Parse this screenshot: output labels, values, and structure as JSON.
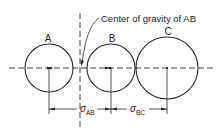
{
  "labels": {
    "circle_a": "A",
    "circle_b": "B",
    "circle_c": "C",
    "cg_annotation": "Center of gravity of AB",
    "sigma": "σ",
    "sub_ab": "AB",
    "sub_bc": "BC"
  },
  "colors": {
    "stroke": "#2a2a2a",
    "background": "#ffffff"
  },
  "geometry": {
    "axis_y": 68,
    "circles": [
      {
        "name": "A",
        "cx": 49,
        "cy": 68,
        "r": 24
      },
      {
        "name": "B",
        "cx": 111,
        "cy": 68,
        "r": 24
      },
      {
        "name": "C",
        "cx": 167,
        "cy": 68,
        "r": 31
      }
    ],
    "cg_x": 80
  }
}
